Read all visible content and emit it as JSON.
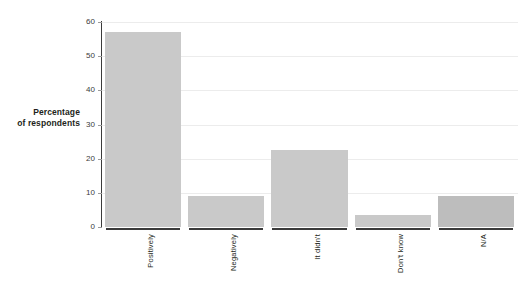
{
  "chart_data": {
    "type": "bar",
    "title": "",
    "subtitle": "",
    "xlabel": "",
    "ylabel": "Percentage of respondents",
    "categories": [
      "Positively",
      "Negatively",
      "It didn't",
      "Don't know",
      "N/A"
    ],
    "values": [
      57,
      9,
      22.5,
      3.5,
      9
    ],
    "series": [
      {
        "name": "Percentage of respondents",
        "values": [
          57,
          9,
          22.5,
          3.5,
          9
        ]
      }
    ],
    "ylim": [
      0,
      60
    ],
    "yticks": [
      0,
      10,
      20,
      30,
      40,
      50,
      60
    ],
    "ytick_labels": [
      "0",
      "10",
      "20",
      "30",
      "40",
      "50",
      "60"
    ],
    "xlim_categories": 5,
    "grid": "horizontal",
    "legend": "none",
    "legend_position": "none",
    "annotations": [],
    "colors": {
      "bar_default": "#c9c9c9",
      "bar_highlight": "#bdbdbd",
      "gridline": "#ececec",
      "axis": "#3b3b3b",
      "text": "#231f20",
      "background": "#ffffff"
    },
    "bar_colors": [
      "#c9c9c9",
      "#c9c9c9",
      "#c9c9c9",
      "#c9c9c9",
      "#bdbdbd"
    ]
  },
  "axis": {
    "y_title_line1": "Percentage",
    "y_title_line2": "of respondents"
  }
}
